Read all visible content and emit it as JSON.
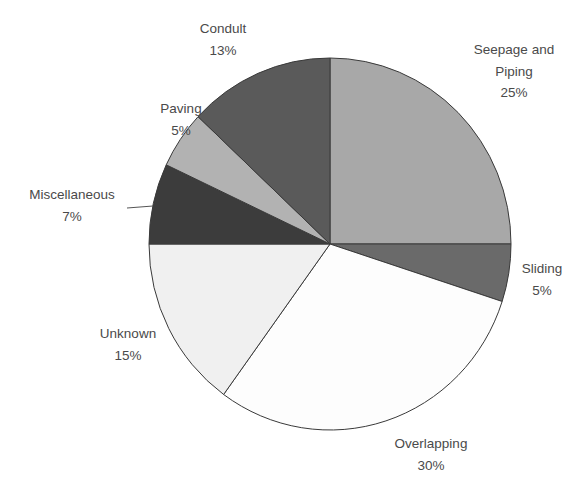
{
  "chart_data": {
    "type": "pie",
    "title": "",
    "start_angle_deg": 0,
    "direction": "clockwise",
    "slices": [
      {
        "name": "Seepage and Piping",
        "label_lines": [
          "Seepage and",
          "Piping"
        ],
        "value": 25,
        "pct_label": "25%",
        "color": "#a8a8a8"
      },
      {
        "name": "Sliding",
        "label_lines": [
          "Sliding"
        ],
        "value": 5,
        "pct_label": "5%",
        "color": "#6a6a6a"
      },
      {
        "name": "Overlapping",
        "label_lines": [
          "Overlapping"
        ],
        "value": 30,
        "pct_label": "30%",
        "color": "#fdfdfd"
      },
      {
        "name": "Unknown",
        "label_lines": [
          "Unknown"
        ],
        "value": 15,
        "pct_label": "15%",
        "color": "#f0f0f0"
      },
      {
        "name": "Miscellaneous",
        "label_lines": [
          "Miscellaneous"
        ],
        "value": 7,
        "pct_label": "7%",
        "color": "#3c3c3c"
      },
      {
        "name": "Paving",
        "label_lines": [
          "Paving"
        ],
        "value": 5,
        "pct_label": "5%",
        "color": "#b2b2b2"
      },
      {
        "name": "Condult",
        "label_lines": [
          "Condult"
        ],
        "value": 13,
        "pct_label": "13%",
        "color": "#5a5a5a"
      }
    ],
    "legend": "none",
    "data_labels": "category name and percentage, outside slices"
  },
  "geometry": {
    "cx": 330,
    "cy": 244,
    "rx": 181,
    "ry": 186
  },
  "labels": [
    {
      "x": 514,
      "y": 54,
      "lines": [
        "Seepage and",
        "Piping",
        "25%"
      ]
    },
    {
      "x": 542,
      "y": 273,
      "lines": [
        "Sliding",
        "5%"
      ]
    },
    {
      "x": 431,
      "y": 448,
      "lines": [
        "Overlapping",
        "30%"
      ]
    },
    {
      "x": 128,
      "y": 338,
      "lines": [
        "Unknown",
        "15%"
      ]
    },
    {
      "x": 72,
      "y": 199,
      "lines": [
        "Miscellaneous",
        "7%"
      ]
    },
    {
      "x": 181,
      "y": 113,
      "lines": [
        "Paving",
        "5%"
      ]
    },
    {
      "x": 223,
      "y": 33,
      "lines": [
        "Condult",
        "13%"
      ]
    }
  ],
  "leaders": [
    {
      "slice": "Miscellaneous",
      "x1": 127,
      "y1": 208,
      "x2": 153,
      "y2": 206
    }
  ]
}
